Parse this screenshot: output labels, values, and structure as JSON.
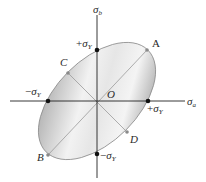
{
  "diagram": {
    "axes": {
      "horizontal": {
        "symbol": "σ",
        "subscript": "a"
      },
      "vertical": {
        "symbol": "σ",
        "subscript": "b"
      }
    },
    "origin_label": "O",
    "ellipse": {
      "rotation_deg": 45,
      "fill_light": "#f2f2f2",
      "fill_dark": "#b8b8b8",
      "stroke": "#888888"
    },
    "intercepts": {
      "top": {
        "sign": "+",
        "symbol": "σ",
        "subscript": "Y"
      },
      "bottom": {
        "sign": "−",
        "symbol": "σ",
        "subscript": "Y"
      },
      "left": {
        "sign": "−",
        "symbol": "σ",
        "subscript": "Y"
      },
      "right": {
        "sign": "+",
        "symbol": "σ",
        "subscript": "Y"
      }
    },
    "points": [
      {
        "label": "A",
        "position": "upper-right end of major axis"
      },
      {
        "label": "B",
        "position": "lower-left end of major axis"
      },
      {
        "label": "C",
        "position": "upper-left end of minor axis"
      },
      {
        "label": "D",
        "position": "lower-right end of minor axis"
      }
    ],
    "colors": {
      "axis": "#222222",
      "dot": "#111111",
      "diag_line": "#9a9a9a",
      "point_dot": "#8a8a8a"
    }
  }
}
